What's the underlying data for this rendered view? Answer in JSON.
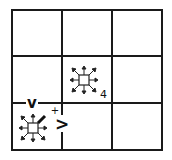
{
  "diagram": {
    "type": "grid-world",
    "rows": 3,
    "cols": 3,
    "line_color": "#1a1a1a",
    "background": "#ffffff",
    "cells": [
      {
        "row": 1,
        "col": 1,
        "content": "empty"
      },
      {
        "row": 1,
        "col": 2,
        "content": "empty"
      },
      {
        "row": 1,
        "col": 3,
        "content": "empty"
      },
      {
        "row": 2,
        "col": 1,
        "content": "empty"
      },
      {
        "row": 2,
        "col": 2,
        "content": "agent-all-directions",
        "label": "4"
      },
      {
        "row": 2,
        "col": 3,
        "content": "empty"
      },
      {
        "row": 3,
        "col": 1,
        "content": "agent-all-directions",
        "highlighted_direction": "northeast"
      },
      {
        "row": 3,
        "col": 2,
        "content": "empty"
      },
      {
        "row": 3,
        "col": 3,
        "content": "empty"
      }
    ],
    "wall_markers": {
      "down_marker": "v",
      "right_marker": ">",
      "plus_marker": "+"
    },
    "icons": {
      "middle_agent": "eight-way-arrows-icon",
      "corner_agent": "eight-way-arrows-icon"
    }
  }
}
